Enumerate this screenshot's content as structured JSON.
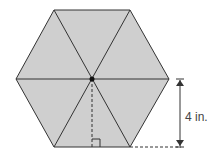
{
  "diagram": {
    "shape": "regular hexagon divided into 6 equilateral triangles",
    "fill_color": "#cfcfcf",
    "stroke_color": "#333333",
    "center_point": "dot",
    "apothem_label": "4 in.",
    "right_angle_marker": true
  }
}
